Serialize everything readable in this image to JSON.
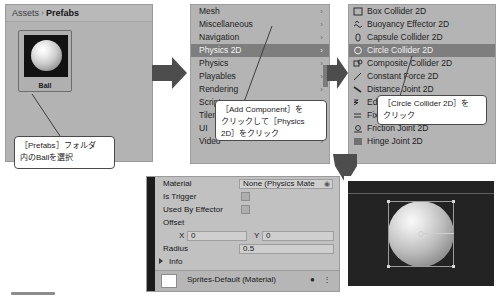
{
  "assets_panel": {
    "breadcrumb": {
      "root": "Assets",
      "separator": "›",
      "current": "Prefabs"
    },
    "asset": {
      "label": "Ball",
      "icon": "sphere-thumbnail-icon"
    },
    "callout": {
      "line1": "［Prefabs］フォルダ",
      "line2": "内のBallを選択"
    }
  },
  "component_menu": {
    "items": [
      {
        "label": "Mesh",
        "has_submenu": true,
        "selected": false
      },
      {
        "label": "Miscellaneous",
        "has_submenu": true,
        "selected": false
      },
      {
        "label": "Navigation",
        "has_submenu": true,
        "selected": false
      },
      {
        "label": "Physics 2D",
        "has_submenu": true,
        "selected": true
      },
      {
        "label": "Physics",
        "has_submenu": true,
        "selected": false
      },
      {
        "label": "Playables",
        "has_submenu": true,
        "selected": false
      },
      {
        "label": "Rendering",
        "has_submenu": true,
        "selected": false
      },
      {
        "label": "Scripts",
        "has_submenu": true,
        "selected": false
      },
      {
        "label": "Tilemap",
        "has_submenu": true,
        "selected": false
      },
      {
        "label": "UI",
        "has_submenu": true,
        "selected": false
      },
      {
        "label": "Video",
        "has_submenu": true,
        "selected": false
      }
    ],
    "submenu_arrow": "›",
    "callout": {
      "line1": "［Add Component］を",
      "line2": "クリックして［Physics",
      "line3": "2D］をクリック"
    }
  },
  "physics2d_menu": {
    "items": [
      {
        "label": "Box Collider 2D",
        "icon": "box-collider-icon",
        "selected": false
      },
      {
        "label": "Buoyancy Effector 2D",
        "icon": "buoyancy-effector-icon",
        "selected": false
      },
      {
        "label": "Capsule Collider 2D",
        "icon": "capsule-collider-icon",
        "selected": false
      },
      {
        "label": "Circle Collider 2D",
        "icon": "circle-collider-icon",
        "selected": true
      },
      {
        "label": "Composite Collider 2D",
        "icon": "composite-collider-icon",
        "selected": false
      },
      {
        "label": "Constant Force 2D",
        "icon": "constant-force-icon",
        "selected": false
      },
      {
        "label": "Distance Joint 2D",
        "icon": "distance-joint-icon",
        "selected": false
      },
      {
        "label": "Edge Collider 2D",
        "icon": "edge-collider-icon",
        "selected": false
      },
      {
        "label": "Fixed Joint 2D",
        "icon": "fixed-joint-icon",
        "selected": false
      },
      {
        "label": "Friction Joint 2D",
        "icon": "friction-joint-icon",
        "selected": false
      },
      {
        "label": "Hinge Joint 2D",
        "icon": "hinge-joint-icon",
        "selected": false
      }
    ],
    "callout": {
      "line1": "［Circle Collider 2D］を",
      "line2": "クリック"
    }
  },
  "inspector": {
    "material": {
      "label": "Material",
      "value": "None (Physics Mate",
      "dropdown_glyph": "◉"
    },
    "is_trigger": {
      "label": "Is Trigger",
      "checked": false
    },
    "used_by_effector": {
      "label": "Used By Effector",
      "checked": false
    },
    "offset": {
      "label": "Offset",
      "x_tag": "X",
      "x_value": "0",
      "y_tag": "Y",
      "y_value": "0"
    },
    "radius": {
      "label": "Radius",
      "value": "0.5"
    },
    "info": {
      "label": "Info"
    },
    "footer": {
      "label": "Sprites-Default (Material)",
      "icons": "● ⋮"
    }
  },
  "scene_preview": {
    "name": "circle-collider-gizmo-preview"
  },
  "colors": {
    "panel_bg": "#b4b4b4",
    "menu_selected": "#7e7e7e",
    "inspector_bg": "#c1c1c1",
    "scene_bg": "#232323",
    "callout_bg": "#ffffff",
    "callout_border": "#4a4a4a",
    "arrow_fill": "#4d4d4d"
  }
}
